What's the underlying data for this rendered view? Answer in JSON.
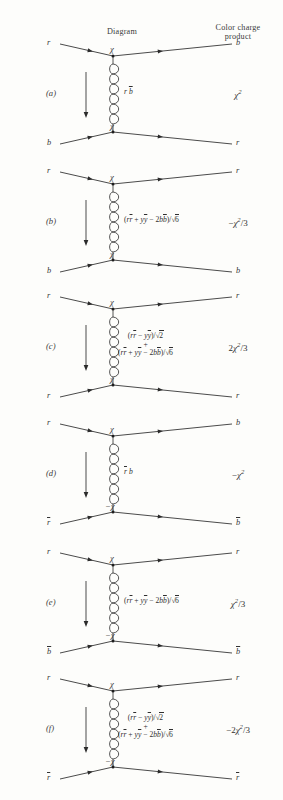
{
  "headers": {
    "diagram": "Diagram",
    "charge_line1": "Color charge",
    "charge_line2": "product"
  },
  "rows": [
    {
      "key": "a",
      "label": "(a)",
      "top_in": "r",
      "top_out": "b",
      "bottom_in": "b",
      "bottom_out": "r",
      "top_vertex": "χ",
      "bottom_vertex": "χ",
      "gluon_label_lines": [
        "r b̄"
      ],
      "gluon_label_plain": "rb̄",
      "charge": "χ²",
      "charge_base": "χ",
      "charge_exp": "2",
      "charge_sign": "",
      "charge_denom": ""
    },
    {
      "key": "b",
      "label": "(b)",
      "top_in": "r",
      "top_out": "r",
      "bottom_in": "b",
      "bottom_out": "b",
      "top_vertex": "χ",
      "bottom_vertex": "χ",
      "gluon_label_lines": [
        "(rr̄ + yȳ − 2bb̄)/√6"
      ],
      "gluon_label_plain": "(rr̄ + yȳ − 2bb̄)/√6",
      "charge": "−χ²/3",
      "charge_base": "χ",
      "charge_exp": "2",
      "charge_sign": "−",
      "charge_denom": "/3"
    },
    {
      "key": "c",
      "label": "(c)",
      "top_in": "r",
      "top_out": "r",
      "bottom_in": "r",
      "bottom_out": "r",
      "top_vertex": "χ",
      "bottom_vertex": "χ",
      "gluon_label_lines": [
        "(rr̄ − yȳ)/√2",
        "+",
        "(rr̄ + yȳ − 2bb̄)/√6"
      ],
      "gluon_label_plain": "(rr̄ − yȳ)/√2 + (rr̄ + yȳ − 2bb̄)/√6",
      "charge": "2χ²/3",
      "charge_base": "χ",
      "charge_exp": "2",
      "charge_sign": "2",
      "charge_denom": "/3"
    },
    {
      "key": "d",
      "label": "(d)",
      "top_in": "r",
      "top_out": "b",
      "bottom_in": "r̄",
      "bottom_out": "b̄",
      "top_vertex": "χ",
      "bottom_vertex": "−χ",
      "gluon_label_lines": [
        "r̄ b"
      ],
      "gluon_label_plain": "r̄b",
      "charge": "−χ²",
      "charge_base": "χ",
      "charge_exp": "2",
      "charge_sign": "−",
      "charge_denom": ""
    },
    {
      "key": "e",
      "label": "(e)",
      "top_in": "r",
      "top_out": "r",
      "bottom_in": "b̄",
      "bottom_out": "b̄",
      "top_vertex": "χ",
      "bottom_vertex": "−χ",
      "gluon_label_lines": [
        "(rr̄ + yȳ − 2bb̄)/√6"
      ],
      "gluon_label_plain": "(rr̄ + yȳ − 2bb̄)/√6",
      "charge": "χ²/3",
      "charge_base": "χ",
      "charge_exp": "2",
      "charge_sign": "",
      "charge_denom": "/3"
    },
    {
      "key": "f",
      "label": "(f)",
      "top_in": "r",
      "top_out": "r",
      "bottom_in": "r̄",
      "bottom_out": "r̄",
      "top_vertex": "χ",
      "bottom_vertex": "−χ",
      "gluon_label_lines": [
        "(rr̄ − yȳ)/√2",
        "+",
        "(rr̄ + yȳ − 2bb̄)/√6"
      ],
      "gluon_label_plain": "(rr̄ − yȳ)/√2 + (rr̄ + yȳ − 2bb̄)/√6",
      "charge": "−2χ²/3",
      "charge_base": "χ",
      "charge_exp": "2",
      "charge_sign": "−2",
      "charge_denom": "/3"
    }
  ],
  "style": {
    "ink": "#2b2b2b",
    "paper": "#fdfdfb"
  }
}
